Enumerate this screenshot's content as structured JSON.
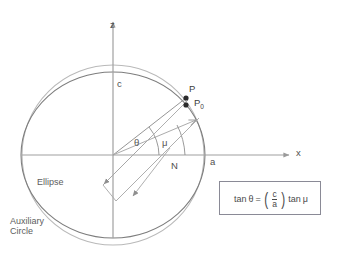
{
  "figure": {
    "type": "geometry-diagram",
    "background": "#ffffff"
  },
  "axes": {
    "z_label": "z",
    "x_label": "x",
    "origin_label": "",
    "z_axis_color": "#9a9a9a",
    "x_axis_color": "#9a9a9a"
  },
  "labels": {
    "semi_minor": "c",
    "semi_major": "a",
    "foot_of_perpendicular": "N",
    "point_on_circle": "P",
    "point_on_ellipse_main": "P",
    "point_on_ellipse_sub": "0",
    "angle_theta": "θ",
    "angle_mu": "μ",
    "ellipse_name": "Ellipse",
    "auxiliary_circle_line1": "Auxiliary",
    "auxiliary_circle_line2": "Circle"
  },
  "formula": {
    "lhs_fn": "tan",
    "lhs_var": "θ",
    "equals": "=",
    "numerator": "c",
    "denominator": "a",
    "rhs_fn": "tan",
    "rhs_var": "μ",
    "border_color": "#8a8a96"
  },
  "colors": {
    "circle_stroke": "#b4b4b4",
    "ellipse_stroke": "#7d7d7d",
    "ray_stroke": "#9d9d9d",
    "band_stroke": "#9d9d9d",
    "arc_stroke": "#8f8f8f",
    "point_fill": "#2b2b2b",
    "text": "#5a5a5a"
  },
  "geometry": {
    "origin_x": 113,
    "origin_y": 155,
    "semi_major_px": 92,
    "semi_minor_px": 83,
    "circle_radius_px": 90,
    "theta_deg": 38,
    "mu_deg": 42
  }
}
